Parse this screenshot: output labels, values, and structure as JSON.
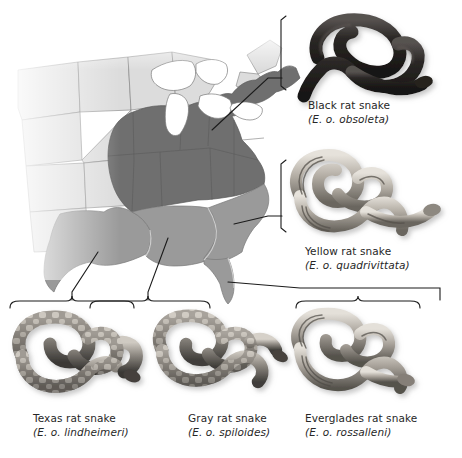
{
  "figure": {
    "credit": "© Cengage Learning, 2017",
    "map": {
      "name": "eastern-united-states-range-map",
      "colors": {
        "range_north": "#6f6f6f",
        "range_south": "#9a9a9a",
        "non_range": "#dcdcdc",
        "outline": "#6d6d6d",
        "water": "#ffffff",
        "background": "#ffffff"
      }
    },
    "specimens": [
      {
        "id": "black-rat-snake",
        "common_name": "Black rat snake",
        "scientific_name": "(E. o. obsoleta)",
        "pattern": "uniform-dark",
        "colors": {
          "body": "#2e2b29",
          "highlight": "#6e6864",
          "shadow": "#171513"
        }
      },
      {
        "id": "yellow-rat-snake",
        "common_name": "Yellow rat snake",
        "scientific_name": "(E. o. quadrivittata)",
        "pattern": "longitudinal-stripes",
        "colors": {
          "body": "#b9b3aa",
          "highlight": "#e2ded7",
          "shadow": "#5d5952"
        }
      },
      {
        "id": "texas-rat-snake",
        "common_name": "Texas rat snake",
        "scientific_name": "(E. o. lindheimeri)",
        "pattern": "blotched",
        "colors": {
          "body": "#75706a",
          "highlight": "#c9c4bc",
          "shadow": "#2c2a27"
        }
      },
      {
        "id": "gray-rat-snake",
        "common_name": "Gray rat snake",
        "scientific_name": "(E. o. spiloides)",
        "pattern": "blotched",
        "colors": {
          "body": "#807b74",
          "highlight": "#d2cdc5",
          "shadow": "#2f2d2a"
        }
      },
      {
        "id": "everglades-rat-snake",
        "common_name": "Everglades rat snake",
        "scientific_name": "(E. o. rossalleni)",
        "pattern": "longitudinal-stripes",
        "colors": {
          "body": "#a39d95",
          "highlight": "#ddd9d2",
          "shadow": "#4a4742"
        }
      }
    ]
  }
}
